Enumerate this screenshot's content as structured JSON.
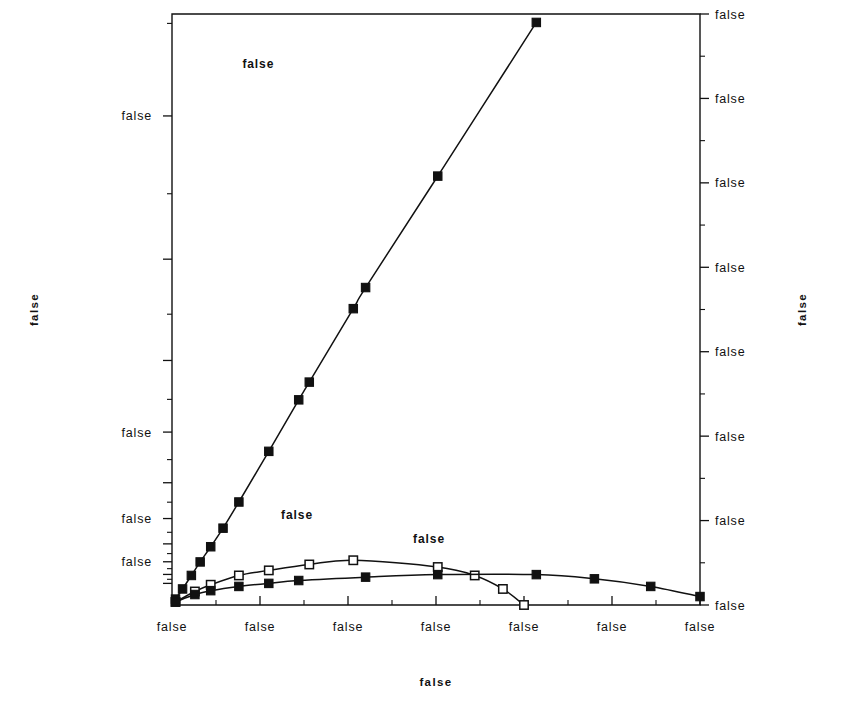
{
  "chart_data": {
    "type": "line",
    "title": "",
    "xlabel": "Mean  Output  Voltage",
    "ylabel": "Accuracy  in  #  of  Bits",
    "y2label": "Signal-to-Noise  Ratio",
    "grid": false,
    "legend_position": "inline-annotations",
    "xlim": [
      0.0,
      3.0
    ],
    "xticks": [
      0.0,
      0.5,
      1.0,
      1.5,
      2.0,
      2.5,
      3.0
    ],
    "xticklabels": [
      "0.0",
      "0.5",
      "1.0",
      "1.5",
      "2.0",
      "2.5",
      "3.0"
    ],
    "x_minor_interval": 0.25,
    "y2lim": [
      0,
      3500
    ],
    "y2ticks": [
      0,
      500,
      1000,
      1500,
      2000,
      2500,
      3000,
      3500
    ],
    "y2ticklabels": [
      "0",
      "500",
      "1000",
      "1500",
      "2000",
      "2500",
      "3000",
      "3500"
    ],
    "y2_minor_interval": 250,
    "ylabel_note": "left axis is log2(SNR) in bits",
    "yticks_bits": [
      8,
      9,
      10,
      11.5
    ],
    "yticklabels_bits": [
      "8",
      "9",
      "10",
      "11.5"
    ],
    "annotations": [
      {
        "text": "Upper  Bounds(Both  States)",
        "x": 0.4,
        "snr": 3180
      },
      {
        "text": "Lower  Bound(\"Off\"  State)",
        "x": 0.62,
        "snr": 510
      },
      {
        "text": "Lower  Bound(\"On\"  State)",
        "x": 1.37,
        "snr": 365
      }
    ],
    "series": [
      {
        "name": "Upper Bounds(Both States)",
        "marker": "filled-square",
        "x": [
          0.02,
          0.06,
          0.11,
          0.16,
          0.22,
          0.29,
          0.38,
          0.55,
          0.72,
          0.78,
          1.03,
          1.1,
          1.51,
          2.07
        ],
        "snr": [
          35,
          95,
          175,
          255,
          345,
          455,
          610,
          910,
          1215,
          1320,
          1755,
          1880,
          2540,
          3450
        ]
      },
      {
        "name": "Lower Bound(\"Off\" State)",
        "marker": "open-square",
        "x": [
          0.02,
          0.13,
          0.22,
          0.38,
          0.55,
          0.78,
          1.03,
          1.51,
          1.72,
          1.88,
          2.0
        ],
        "snr": [
          18,
          80,
          120,
          175,
          205,
          240,
          265,
          225,
          175,
          95,
          0
        ]
      },
      {
        "name": "Lower Bound(\"On\" State)",
        "marker": "filled-square",
        "x": [
          0.02,
          0.13,
          0.22,
          0.38,
          0.55,
          0.72,
          1.1,
          1.51,
          2.07,
          2.4,
          2.72,
          3.0
        ],
        "snr": [
          18,
          62,
          85,
          110,
          128,
          145,
          165,
          180,
          180,
          155,
          110,
          50
        ]
      }
    ]
  }
}
